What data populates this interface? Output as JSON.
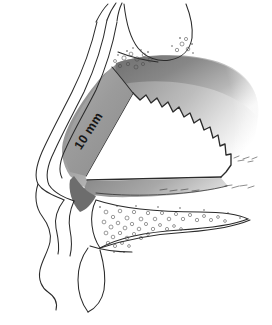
{
  "figure": {
    "kind": "anatomical-line-drawing",
    "view": "lateral-sagittal-section",
    "background_color": "#ffffff",
    "ink_color": "#2b2b2b",
    "shade_light": "#d7d7d7",
    "shade_mid": "#9c9c9c",
    "shade_dark": "#6f6f6f",
    "resection_fill": "#ffffff",
    "annotations": {
      "measurement": {
        "text": "10 mm",
        "rotation_deg": -57,
        "x": 92,
        "y": 133,
        "describes": "dorsal-caudal strut width"
      }
    },
    "regions": [
      {
        "name": "facial-profile-outline",
        "label": ""
      },
      {
        "name": "nasal-dorsum",
        "label": ""
      },
      {
        "name": "nasal-tip-columella",
        "label": ""
      },
      {
        "name": "upper-lip-profile",
        "label": ""
      },
      {
        "name": "nasal-bone-stipple",
        "label": ""
      },
      {
        "name": "septal-cartilage-shaded",
        "label": ""
      },
      {
        "name": "resected-quadrangular-window",
        "label": ""
      },
      {
        "name": "jagged-bony-cartilaginous-junction",
        "label": ""
      },
      {
        "name": "maxillary-crest-vomer-stipple",
        "label": ""
      },
      {
        "name": "anterior-nasal-spine",
        "label": ""
      }
    ]
  }
}
